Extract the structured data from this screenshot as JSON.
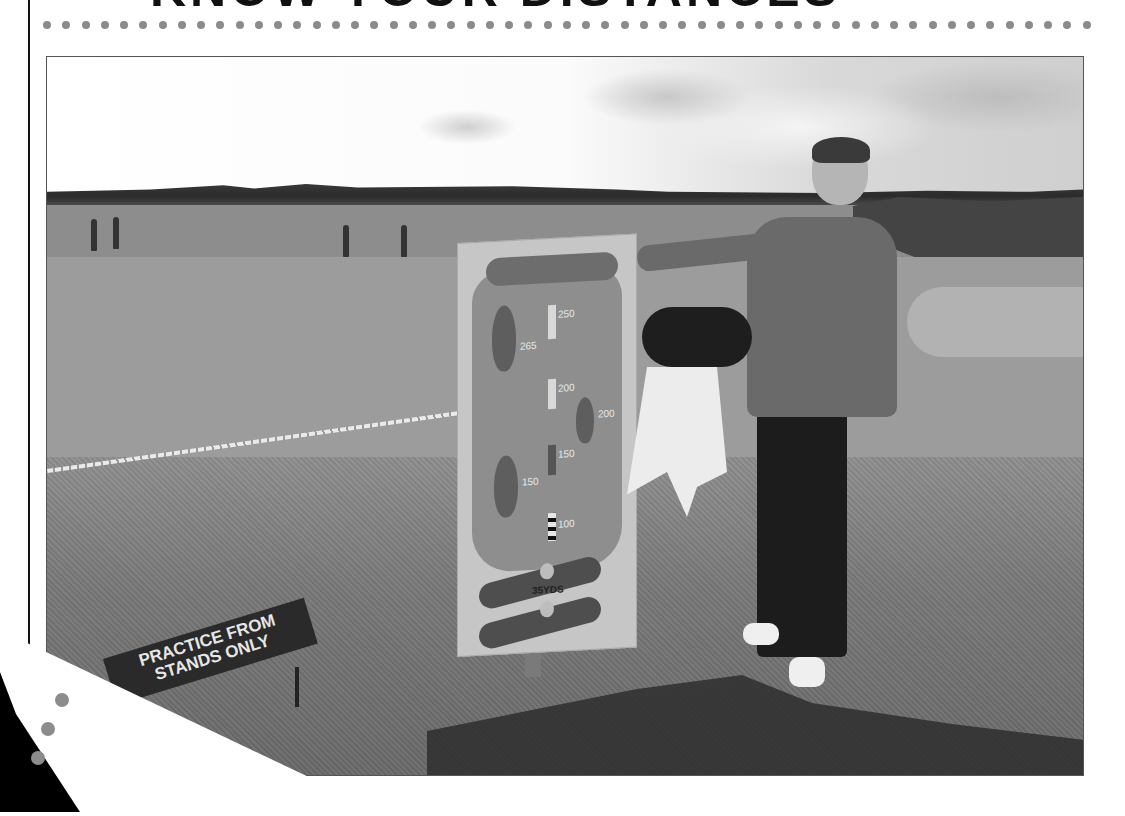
{
  "page": {
    "heading_fragment": "KNOW YOUR DISTANCES",
    "dot_count": 55,
    "dot_color": "#8b8b8b",
    "rule_color": "#111111"
  },
  "photo": {
    "description": "Golfer standing beside a driving-range distance sign on a practice ground",
    "distance_sign": {
      "labels": [
        "250",
        "265",
        "200",
        "200",
        "150",
        "150",
        "100"
      ],
      "bottom_label": "35YDS"
    },
    "ground_sign": {
      "line1": "PRACTICE FROM",
      "line2": "STANDS ONLY"
    }
  }
}
